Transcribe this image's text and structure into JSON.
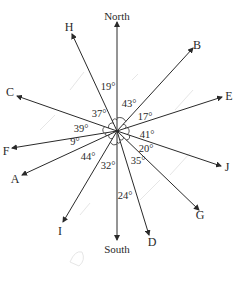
{
  "diagram": {
    "center": {
      "x": 117,
      "y": 131
    },
    "rays": [
      {
        "id": "north",
        "label": "North",
        "tip": [
          117,
          22
        ],
        "label_pos": [
          117,
          20
        ]
      },
      {
        "id": "H",
        "label": "H",
        "tip": [
          72,
          34
        ],
        "label_pos": [
          69,
          31
        ]
      },
      {
        "id": "B",
        "label": "B",
        "tip": [
          193,
          48
        ],
        "label_pos": [
          197,
          49
        ]
      },
      {
        "id": "C",
        "label": "C",
        "tip": [
          17,
          96
        ],
        "label_pos": [
          10,
          96
        ]
      },
      {
        "id": "E",
        "label": "E",
        "tip": [
          222,
          97
        ],
        "label_pos": [
          229,
          100
        ]
      },
      {
        "id": "F",
        "label": "F",
        "tip": [
          12,
          148
        ],
        "label_pos": [
          6,
          155
        ]
      },
      {
        "id": "A",
        "label": "A",
        "tip": [
          22,
          175
        ],
        "label_pos": [
          15,
          183
        ]
      },
      {
        "id": "J",
        "label": "J",
        "tip": [
          221,
          166
        ],
        "label_pos": [
          227,
          171
        ]
      },
      {
        "id": "G",
        "label": "G",
        "tip": [
          199,
          210
        ],
        "label_pos": [
          200,
          219
        ]
      },
      {
        "id": "I",
        "label": "I",
        "tip": [
          63,
          222
        ],
        "label_pos": [
          60,
          235
        ]
      },
      {
        "id": "south",
        "label": "South",
        "tip": [
          117,
          240
        ],
        "label_pos": [
          117,
          253
        ]
      },
      {
        "id": "D",
        "label": "D",
        "tip": [
          149,
          235
        ],
        "label_pos": [
          152,
          246
        ]
      }
    ],
    "angles": [
      {
        "between": "North-H",
        "label": "19°",
        "pos": [
          108,
          90
        ]
      },
      {
        "between": "North-B",
        "label": "43°",
        "pos": [
          129,
          107
        ]
      },
      {
        "between": "H-C",
        "label": "37°",
        "pos": [
          99,
          117
        ]
      },
      {
        "between": "B-E",
        "label": "17°",
        "pos": [
          145,
          120
        ]
      },
      {
        "between": "C-F",
        "label": "39°",
        "pos": [
          81,
          132
        ]
      },
      {
        "between": "E-J",
        "label": "41°",
        "pos": [
          147,
          138
        ]
      },
      {
        "between": "F-A",
        "label": "9°",
        "pos": [
          75,
          145
        ]
      },
      {
        "between": "J-G",
        "label": "20°",
        "pos": [
          146,
          152
        ]
      },
      {
        "between": "A-I",
        "label": "44°",
        "pos": [
          88,
          160
        ]
      },
      {
        "between": "I-South",
        "label": "32°",
        "pos": [
          108,
          169
        ]
      },
      {
        "between": "South-G",
        "label": "35°",
        "pos": [
          138,
          164
        ]
      },
      {
        "between": "South-D",
        "label": "24°",
        "pos": [
          125,
          199
        ]
      }
    ],
    "colors": {
      "line": "#2a2a2a",
      "text": "#2a2a2a",
      "background": "#ffffff",
      "watermark": "#e2e2e2"
    }
  }
}
